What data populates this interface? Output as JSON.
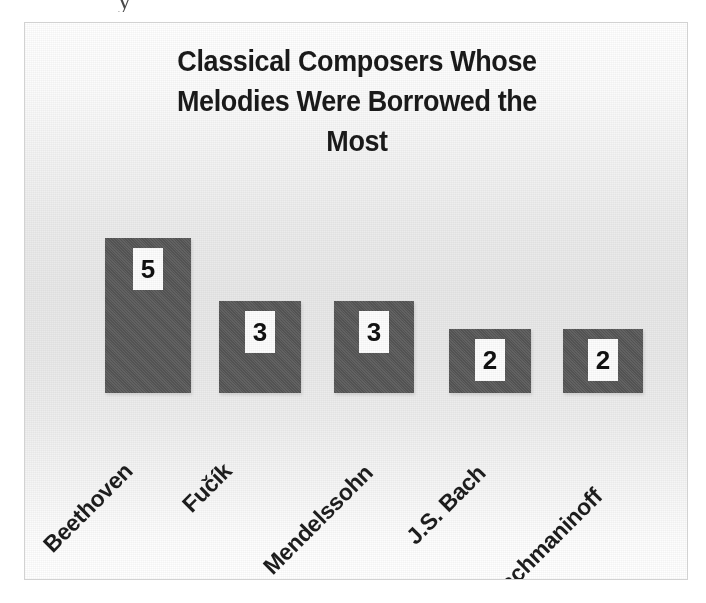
{
  "figure": {
    "scan_artifact_text": "y",
    "frame_border_color": "#d2d2d2",
    "plot_background_top": "#ffffff",
    "plot_background_mid": "#e8e8e8",
    "bar_color": "#585858",
    "value_label_bg": "#fdfdfd",
    "value_label_color": "#111111",
    "title_color": "#1a1a1a",
    "category_label_color": "#1d1d1d"
  },
  "chart_data": {
    "type": "bar",
    "title": "Classical Composers Whose\nMelodies Were Borrowed the\nMost",
    "title_lines": [
      "Classical Composers Whose",
      "Melodies Were Borrowed the",
      "Most"
    ],
    "categories": [
      "Beethoven",
      "Fučík",
      "Mendelssohn",
      "J.S. Bach",
      "Rachmaninoff"
    ],
    "values": [
      5,
      3,
      3,
      2,
      2
    ],
    "value_labels": [
      "5",
      "3",
      "3",
      "2",
      "2"
    ],
    "xlabel": "",
    "ylabel": "",
    "ylim": [
      0,
      5
    ],
    "grid": false,
    "legend": false,
    "axis_visible": false,
    "tick_labels_rotated_deg": -45,
    "bars": [
      {
        "category": "Beethoven",
        "value": 5,
        "label": "5",
        "left": 80,
        "width": 86,
        "height": 155
      },
      {
        "category": "Fučík",
        "value": 3,
        "label": "3",
        "left": 194,
        "width": 82,
        "height": 92
      },
      {
        "category": "Mendelssohn",
        "value": 3,
        "label": "3",
        "left": 309,
        "width": 80,
        "height": 92
      },
      {
        "category": "J.S. Bach",
        "value": 2,
        "label": "2",
        "left": 424,
        "width": 82,
        "height": 64
      },
      {
        "category": "Rachmaninoff",
        "value": 2,
        "label": "2",
        "left": 538,
        "width": 80,
        "height": 64
      }
    ],
    "label_anchors": [
      {
        "text": "Beethoven",
        "x": 32,
        "y": 508
      },
      {
        "text": "Fučík",
        "x": 171,
        "y": 468
      },
      {
        "text": "Mendelssohn",
        "x": 252,
        "y": 530
      },
      {
        "text": "J.S. Bach",
        "x": 395,
        "y": 500
      },
      {
        "text": "Rachmaninoff",
        "x": 477,
        "y": 558
      }
    ]
  }
}
